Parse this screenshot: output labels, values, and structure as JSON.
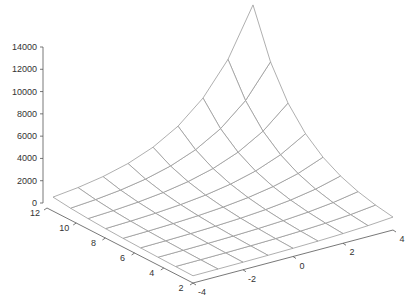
{
  "chart_data": {
    "type": "surface",
    "title": "",
    "xlabel": "",
    "ylabel": "",
    "zlabel": "",
    "x": [
      -4,
      -3,
      -2,
      -1,
      0,
      1,
      2,
      3,
      4
    ],
    "y": [
      2,
      3.25,
      4.5,
      5.75,
      7,
      8.25,
      9.5,
      10.75,
      12
    ],
    "z_peak": 14000,
    "xlim": [
      -4,
      4
    ],
    "ylim": [
      2,
      12
    ],
    "zlim": [
      0,
      14000
    ],
    "x_ticks": [
      "-4",
      "-2",
      "0",
      "2",
      "4"
    ],
    "y_ticks": [
      "2",
      "4",
      "6",
      "8",
      "10",
      "12"
    ],
    "z_ticks": [
      "0",
      "2000",
      "4000",
      "6000",
      "8000",
      "10000",
      "12000",
      "14000"
    ],
    "grid": false,
    "mesh_color": "#9a9a9a"
  }
}
